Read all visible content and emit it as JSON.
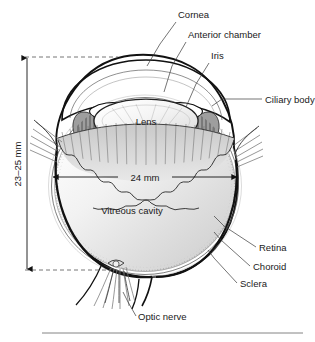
{
  "figure": {
    "type": "anatomical-diagram",
    "background_color": "#ffffff",
    "ink_color": "#111111",
    "leader_color": "#3a3a3a"
  },
  "labels": {
    "cornea": "Cornea",
    "anterior_chamber": "Anterior chamber",
    "iris": "Iris",
    "ciliary_body": "Ciliary body",
    "lens": "Lens",
    "vitreous_cavity": "Vitreous cavity",
    "retina": "Retina",
    "choroid": "Choroid",
    "sclera": "Sclera",
    "optic_nerve": "Optic nerve"
  },
  "dimensions": {
    "height_label": "23–25 mm",
    "width_label": "24 mm"
  },
  "footer": {
    "rule_visible": true
  }
}
